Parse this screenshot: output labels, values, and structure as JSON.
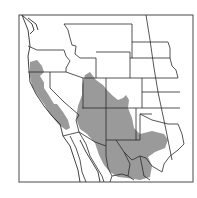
{
  "map": {
    "type": "species-range-map",
    "region": "Western United States and northern Mexico",
    "colors": {
      "background": "#ffffff",
      "range_fill": "#9a9a9a",
      "border": "#2a2a2a",
      "frame": "#5a5a5a"
    },
    "frame": {
      "x": 19,
      "y": 15,
      "width": 174,
      "height": 167
    },
    "range_areas": [
      {
        "name": "pacific-coast-range",
        "d": "M30,62 L37,60 L42,66 L44,72 L40,76 L45,84 L52,96 L57,104 L63,112 L68,120 L70,128 L66,130 L58,124 L50,114 L44,104 L38,96 L32,86 L30,76 Z"
      },
      {
        "name": "central-valley-gap",
        "d": "M44,82 L48,86 L54,96 L58,104 L54,104 L48,94 L44,88 Z"
      },
      {
        "name": "southwest-main-range",
        "d": "M85,75 L90,72 L96,80 L103,85 L107,90 L113,96 L118,100 L123,98 L126,95 L129,100 L128,108 L132,118 L134,128 L140,134 L152,131 L164,134 L168,140 L165,148 L155,152 L148,157 L152,166 L150,177 L140,180 L128,178 L118,177 L110,172 L104,165 L99,155 L95,143 L87,134 L80,129 L76,118 L78,106 L82,95 L82,85 Z"
      }
    ],
    "state_borders": [
      {
        "name": "wa-or",
        "d": "M28,46 L37,50 L50,50 L64,50"
      },
      {
        "name": "or-id",
        "d": "M64,50 L66,56 L70,61 L66,68 L66,72"
      },
      {
        "name": "or-ca-nv",
        "d": "M28,72 L50,72 L66,72"
      },
      {
        "name": "id-mt",
        "d": "M64,24 L68,30 L70,38 L72,45 L76,46 L75,54 L80,58 L96,58"
      },
      {
        "name": "id-wy-ut",
        "d": "M96,58 L96,68 L96,78 L83,78 L66,72"
      },
      {
        "name": "nv-ut",
        "d": "M83,78 L83,108"
      },
      {
        "name": "ca-nv",
        "d": "M50,72 L50,88 L64,102 L79,115"
      },
      {
        "name": "ut-co",
        "d": "M106,78 L106,108"
      },
      {
        "name": "wy-co",
        "d": "M96,78 L142,78"
      },
      {
        "name": "mt-wy",
        "d": "M96,52 L130,52 L130,78"
      },
      {
        "name": "mt-top",
        "d": "M64,24 L132,24"
      },
      {
        "name": "az-nm-4corners",
        "d": "M82,108 L106,108 L140,108"
      },
      {
        "name": "az-nm",
        "d": "M106,108 L106,140"
      },
      {
        "name": "nm-south",
        "d": "M106,140 L116,140 L136,140"
      },
      {
        "name": "az-south",
        "d": "M79,132 L95,142 L106,146 L106,140"
      },
      {
        "name": "az-ca-river",
        "d": "M79,115 L76,120 L78,128 L79,132"
      },
      {
        "name": "ca-mexico",
        "d": "M63,136 L79,132"
      },
      {
        "name": "nm-tx",
        "d": "M136,108 L136,140 L140,140 L140,114 L152,114"
      },
      {
        "name": "ok-tx-red-river",
        "d": "M140,114 L152,120 L160,122 L168,124 L178,124"
      },
      {
        "name": "co-ks",
        "d": "M142,78 L142,92 L142,108"
      },
      {
        "name": "ks-ne",
        "d": "M142,78 L178,78"
      },
      {
        "name": "sd-ne",
        "d": "M132,58 L170,58"
      },
      {
        "name": "nd-sd",
        "d": "M132,42 L168,42"
      },
      {
        "name": "nd-mt-top",
        "d": "M132,24 L132,42"
      },
      {
        "name": "wy-ne-sd",
        "d": "M130,58 L132,58 L132,52 L132,42"
      },
      {
        "name": "ks-ok",
        "d": "M142,92 L180,92"
      },
      {
        "name": "ok-panhandle",
        "d": "M140,108 L180,108"
      },
      {
        "name": "ne-sd-east",
        "d": "M168,42 L170,48 L170,58 L172,66 L176,70 L178,78"
      },
      {
        "name": "mississippi-meridian",
        "d": "M146,15 L150,40 L154,68 L158,92 L166,130 L172,160"
      },
      {
        "name": "tx-gulf-coast",
        "d": "M178,124 L182,134 L184,144 L178,150 L170,156 L164,164 L162,172"
      },
      {
        "name": "mexico-rio-grande",
        "d": "M116,140 L124,152 L132,160 L140,156 L146,158 L152,166 L162,172"
      },
      {
        "name": "mexico-chihuahua-coahuila",
        "d": "M124,152 L130,164 L128,176 L134,180"
      },
      {
        "name": "mexico-coahuila-nl",
        "d": "M140,156 L142,166 L144,176 L150,180"
      },
      {
        "name": "mexico-sonora-chihuahua",
        "d": "M106,146 L106,156 L108,168 L112,176 L110,182"
      },
      {
        "name": "mexico-son-baja-gulf",
        "d": "M79,132 L86,144 L90,156 L96,166 L102,176 L104,182"
      },
      {
        "name": "mexico-sinaloa",
        "d": "M112,176 L122,174 L128,176"
      },
      {
        "name": "baja-inner",
        "d": "M70,136 L76,148 L80,160 L82,172 L86,182"
      }
    ],
    "coastlines": [
      {
        "name": "pacific-coast",
        "d": "M22,15 L28,30 L30,46 L28,56 L29,70 L30,82 L36,94 L44,106 L52,116 L60,124 L63,136 L70,146 L74,158 L78,170 L80,182"
      },
      {
        "name": "puget-sound",
        "d": "M22,15 L32,24 L34,30 L30,34 M28,18 L36,24 L38,30"
      },
      {
        "name": "baja-gulf-coast",
        "d": "M80,140 L86,152 L92,162 L98,172 L100,182"
      }
    ]
  }
}
